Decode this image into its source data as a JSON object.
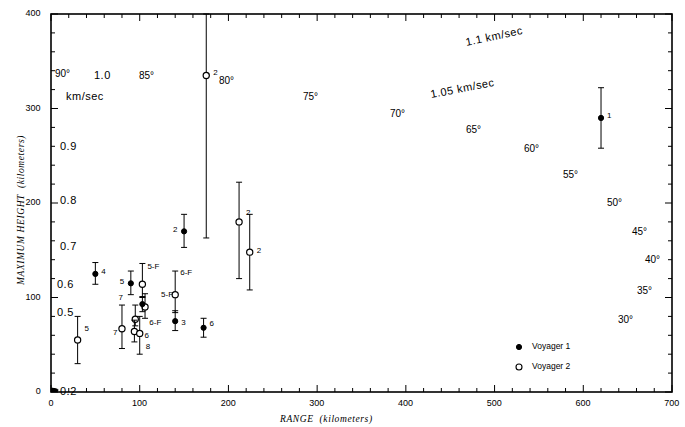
{
  "figure": {
    "xlabel_main": "RANGE",
    "xlabel_unit": "(kilometers)",
    "ylabel_main": "MAXIMUM HEIGHT",
    "ylabel_unit": "(kilometers)"
  },
  "legend": {
    "items": [
      {
        "marker": "filled-circle",
        "label": "Voyager 1"
      },
      {
        "marker": "open-circle",
        "label": "Voyager 2"
      }
    ]
  },
  "axis": {
    "x_ticks": [
      "0",
      "100",
      "200",
      "300",
      "400",
      "500",
      "600",
      "700"
    ],
    "y_ticks": [
      "0",
      "100",
      "200",
      "300",
      "400"
    ]
  },
  "velocity_labels": [
    {
      "text": "0.2",
      "x": 60,
      "y": 385
    },
    {
      "text": "0.5",
      "x": 57,
      "y": 306
    },
    {
      "text": "0.6",
      "x": 57,
      "y": 278
    },
    {
      "text": "0.7",
      "x": 60,
      "y": 240
    },
    {
      "text": "0.8",
      "x": 60,
      "y": 194
    },
    {
      "text": "0.9",
      "x": 60,
      "y": 140
    },
    {
      "text": "1.0",
      "x": 94,
      "y": 69
    },
    {
      "text": "km/sec",
      "x": 66,
      "y": 90
    },
    {
      "text": "1.05 km/sec",
      "x": 430,
      "y": 82,
      "rot": -11
    },
    {
      "text": "1.1 km/sec",
      "x": 465,
      "y": 30,
      "rot": -12
    }
  ],
  "angle_labels": [
    {
      "text": "90°",
      "x": 55,
      "y": 68
    },
    {
      "text": "85°",
      "x": 139,
      "y": 70
    },
    {
      "text": "80°",
      "x": 219,
      "y": 75
    },
    {
      "text": "75°",
      "x": 303,
      "y": 91
    },
    {
      "text": "70°",
      "x": 390,
      "y": 108
    },
    {
      "text": "65°",
      "x": 466,
      "y": 124
    },
    {
      "text": "60°",
      "x": 524,
      "y": 143
    },
    {
      "text": "55°",
      "x": 563,
      "y": 169
    },
    {
      "text": "50°",
      "x": 607,
      "y": 197
    },
    {
      "text": "45°",
      "x": 632,
      "y": 226
    },
    {
      "text": "40°",
      "x": 645,
      "y": 254
    },
    {
      "text": "35°",
      "x": 637,
      "y": 285
    },
    {
      "text": "30°",
      "x": 618,
      "y": 314
    }
  ],
  "chart_data": {
    "type": "scatter",
    "title": "",
    "xlabel": "RANGE (kilometers)",
    "ylabel": "MAXIMUM HEIGHT (kilometers)",
    "xlim": [
      0,
      700
    ],
    "ylim": [
      0,
      400
    ],
    "xticks": [
      0,
      100,
      200,
      300,
      400,
      500,
      600,
      700
    ],
    "yticks": [
      0,
      100,
      200,
      300,
      400
    ],
    "grid": false,
    "legend_position": "bottom-right",
    "series": [
      {
        "name": "Voyager 1",
        "marker": "filled-circle"
      },
      {
        "name": "Voyager 2",
        "marker": "open-circle"
      }
    ],
    "velocity_contours_km_per_sec": [
      0.2,
      0.5,
      0.6,
      0.7,
      0.8,
      0.9,
      1.0,
      1.05,
      1.1
    ],
    "ejection_angles_deg": [
      30,
      35,
      40,
      45,
      50,
      55,
      60,
      65,
      70,
      75,
      80,
      85,
      90
    ],
    "points": [
      {
        "label": "1",
        "series": "Voyager 1",
        "range": 620,
        "height": 290,
        "err_low": 258,
        "err_high": 322,
        "lab_dx": 6,
        "lab_dy": -2
      },
      {
        "label": "2",
        "series": "Voyager 2",
        "range": 175,
        "height": 335,
        "err_low": 163,
        "err_high": 400,
        "lab_dx": 7,
        "lab_dy": -2
      },
      {
        "label": "2",
        "series": "Voyager 1",
        "range": 150,
        "height": 170,
        "err_low": 153,
        "err_high": 188,
        "lab_dx": -11,
        "lab_dy": -1
      },
      {
        "label": "2",
        "series": "Voyager 2",
        "range": 212,
        "height": 180,
        "err_low": 120,
        "err_high": 222,
        "lab_dx": 7,
        "lab_dy": -9
      },
      {
        "label": "2",
        "series": "Voyager 2",
        "range": 224,
        "height": 148,
        "err_low": 108,
        "err_high": 188,
        "lab_dx": 7,
        "lab_dy": -1
      },
      {
        "label": "4",
        "series": "Voyager 1",
        "range": 50,
        "height": 125,
        "err_low": 114,
        "err_high": 137,
        "lab_dx": 6,
        "lab_dy": -2
      },
      {
        "label": "5",
        "series": "Voyager 2",
        "range": 30,
        "height": 55,
        "err_low": 30,
        "err_high": 80,
        "lab_dx": 7,
        "lab_dy": -11
      },
      {
        "label": "5",
        "series": "Voyager 1",
        "range": 90,
        "height": 115,
        "err_low": 103,
        "err_high": 128,
        "lab_dx": -11,
        "lab_dy": -1
      },
      {
        "label": "5-F",
        "series": "Voyager 2",
        "range": 103,
        "height": 114,
        "err_low": 100,
        "err_high": 136,
        "lab_dx": 5,
        "lab_dy": -17
      },
      {
        "label": "5-F",
        "series": "Voyager 2",
        "range": 106,
        "height": 90,
        "err_low": 78,
        "err_high": 104,
        "lab_dx": 16,
        "lab_dy": -12
      },
      {
        "label": "6-F",
        "series": "Voyager 2",
        "range": 140,
        "height": 103,
        "err_low": 84,
        "err_high": 128,
        "lab_dx": 5,
        "lab_dy": -22
      },
      {
        "label": "6-F",
        "series": "Voyager 2",
        "range": 95,
        "height": 77,
        "err_low": 70,
        "err_high": 92,
        "lab_dx": 14,
        "lab_dy": 4
      },
      {
        "label": "7",
        "series": "Voyager 1",
        "range": 103,
        "height": 93,
        "err_low": 85,
        "err_high": 101,
        "lab_dx": -24,
        "lab_dy": -6
      },
      {
        "label": "7",
        "series": "Voyager 2",
        "range": 80,
        "height": 67,
        "err_low": 46,
        "err_high": 92,
        "lab_dx": -9,
        "lab_dy": 4
      },
      {
        "label": "6",
        "series": "Voyager 2",
        "range": 94,
        "height": 64,
        "err_low": 53,
        "err_high": 76,
        "lab_dx": 10,
        "lab_dy": 4
      },
      {
        "label": "8",
        "series": "Voyager 2",
        "range": 100,
        "height": 62,
        "err_low": 40,
        "err_high": 80,
        "lab_dx": 6,
        "lab_dy": 14
      },
      {
        "label": "3",
        "series": "Voyager 1",
        "range": 140,
        "height": 75,
        "err_low": 65,
        "err_high": 86,
        "lab_dx": 6,
        "lab_dy": 2
      },
      {
        "label": "6",
        "series": "Voyager 1",
        "range": 172,
        "height": 68,
        "err_low": 58,
        "err_high": 78,
        "lab_dx": 6,
        "lab_dy": 0
      }
    ]
  }
}
